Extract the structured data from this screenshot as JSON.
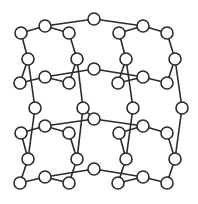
{
  "diagram": {
    "type": "graph",
    "node_radius": 6,
    "colors": {
      "stroke": "#2a2a2a",
      "fill": "#ffffff",
      "background": "#ffffff"
    },
    "nodes": [
      {
        "id": "A1",
        "x": 21,
        "y": 33
      },
      {
        "id": "A2",
        "x": 45,
        "y": 26
      },
      {
        "id": "A3",
        "x": 69,
        "y": 33
      },
      {
        "id": "A4",
        "x": 28,
        "y": 59
      },
      {
        "id": "A5",
        "x": 77,
        "y": 59
      },
      {
        "id": "A6",
        "x": 20,
        "y": 83
      },
      {
        "id": "A7",
        "x": 45,
        "y": 77
      },
      {
        "id": "A8",
        "x": 69,
        "y": 83
      },
      {
        "id": "X1",
        "x": 94,
        "y": 19
      },
      {
        "id": "X2",
        "x": 94,
        "y": 69
      },
      {
        "id": "C1",
        "x": 119,
        "y": 33
      },
      {
        "id": "C2",
        "x": 143,
        "y": 26
      },
      {
        "id": "C3",
        "x": 167,
        "y": 33
      },
      {
        "id": "C4",
        "x": 126,
        "y": 59
      },
      {
        "id": "C5",
        "x": 175,
        "y": 59
      },
      {
        "id": "C6",
        "x": 118,
        "y": 83
      },
      {
        "id": "C7",
        "x": 143,
        "y": 77
      },
      {
        "id": "C8",
        "x": 167,
        "y": 83
      },
      {
        "id": "M1",
        "x": 35,
        "y": 108
      },
      {
        "id": "M2",
        "x": 83,
        "y": 108
      },
      {
        "id": "M3",
        "x": 133,
        "y": 108
      },
      {
        "id": "M4",
        "x": 182,
        "y": 108
      },
      {
        "id": "D1",
        "x": 21,
        "y": 133
      },
      {
        "id": "D2",
        "x": 45,
        "y": 126
      },
      {
        "id": "D3",
        "x": 69,
        "y": 133
      },
      {
        "id": "D4",
        "x": 28,
        "y": 159
      },
      {
        "id": "D5",
        "x": 77,
        "y": 159
      },
      {
        "id": "D6",
        "x": 20,
        "y": 183
      },
      {
        "id": "D7",
        "x": 45,
        "y": 177
      },
      {
        "id": "D8",
        "x": 69,
        "y": 183
      },
      {
        "id": "X3",
        "x": 94,
        "y": 119
      },
      {
        "id": "X4",
        "x": 94,
        "y": 169
      },
      {
        "id": "E1",
        "x": 119,
        "y": 133
      },
      {
        "id": "E2",
        "x": 143,
        "y": 126
      },
      {
        "id": "E3",
        "x": 167,
        "y": 133
      },
      {
        "id": "E4",
        "x": 126,
        "y": 159
      },
      {
        "id": "E5",
        "x": 175,
        "y": 159
      },
      {
        "id": "E6",
        "x": 118,
        "y": 183
      },
      {
        "id": "E7",
        "x": 143,
        "y": 177
      },
      {
        "id": "E8",
        "x": 167,
        "y": 183
      }
    ],
    "edges": [
      [
        "A1",
        "A2"
      ],
      [
        "A2",
        "A3"
      ],
      [
        "A1",
        "A4"
      ],
      [
        "A3",
        "A5"
      ],
      [
        "A4",
        "A6"
      ],
      [
        "A6",
        "A7"
      ],
      [
        "A7",
        "A8"
      ],
      [
        "A8",
        "A5"
      ],
      [
        "A2",
        "X1"
      ],
      [
        "A7",
        "X2"
      ],
      [
        "A4",
        "M1"
      ],
      [
        "A5",
        "M2"
      ],
      [
        "X1",
        "C2"
      ],
      [
        "X2",
        "C7"
      ],
      [
        "C1",
        "C2"
      ],
      [
        "C2",
        "C3"
      ],
      [
        "C1",
        "C4"
      ],
      [
        "C3",
        "C5"
      ],
      [
        "C4",
        "C6"
      ],
      [
        "C6",
        "C7"
      ],
      [
        "C7",
        "C8"
      ],
      [
        "C8",
        "C5"
      ],
      [
        "C4",
        "M3"
      ],
      [
        "C5",
        "M4"
      ],
      [
        "M1",
        "D4"
      ],
      [
        "M2",
        "D5"
      ],
      [
        "M3",
        "E4"
      ],
      [
        "M4",
        "E5"
      ],
      [
        "D1",
        "D2"
      ],
      [
        "D2",
        "D3"
      ],
      [
        "D1",
        "D4"
      ],
      [
        "D3",
        "D5"
      ],
      [
        "D4",
        "D6"
      ],
      [
        "D6",
        "D7"
      ],
      [
        "D7",
        "D8"
      ],
      [
        "D8",
        "D5"
      ],
      [
        "D2",
        "X3"
      ],
      [
        "D7",
        "X4"
      ],
      [
        "M2",
        "X3"
      ],
      [
        "X3",
        "E2"
      ],
      [
        "X4",
        "E7"
      ],
      [
        "E1",
        "E2"
      ],
      [
        "E2",
        "E3"
      ],
      [
        "E1",
        "E4"
      ],
      [
        "E3",
        "E5"
      ],
      [
        "E4",
        "E6"
      ],
      [
        "E6",
        "E7"
      ],
      [
        "E7",
        "E8"
      ],
      [
        "E8",
        "E5"
      ]
    ]
  }
}
